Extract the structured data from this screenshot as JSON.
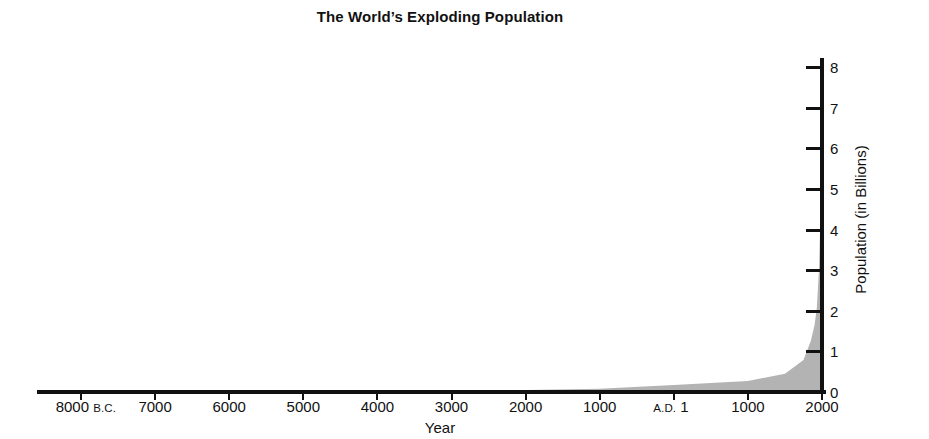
{
  "chart_data": {
    "type": "area",
    "title": "The World’s Exploding Population",
    "xlabel": "Year",
    "ylabel": "Population (in Billions)",
    "xtick_labels": [
      {
        "main": "8000",
        "era": "B.C."
      },
      {
        "main": "7000",
        "era": ""
      },
      {
        "main": "6000",
        "era": ""
      },
      {
        "main": "5000",
        "era": ""
      },
      {
        "main": "4000",
        "era": ""
      },
      {
        "main": "3000",
        "era": ""
      },
      {
        "main": "2000",
        "era": ""
      },
      {
        "main": "1000",
        "era": ""
      },
      {
        "main": "1",
        "era": "A.D."
      },
      {
        "main": "1000",
        "era": ""
      },
      {
        "main": "2000",
        "era": ""
      }
    ],
    "ytick_labels": [
      "0",
      "1",
      "2",
      "3",
      "4",
      "5",
      "6",
      "7",
      "8"
    ],
    "ylim": [
      0,
      8
    ],
    "xlim": [
      -8000,
      2000
    ],
    "x": [
      -8000,
      -7000,
      -6000,
      -5000,
      -4000,
      -3000,
      -2000,
      -1000,
      1,
      1000,
      1500,
      1750,
      1850,
      1900,
      1930,
      1960,
      1975,
      1990,
      2000
    ],
    "values": [
      0.005,
      0.006,
      0.007,
      0.01,
      0.02,
      0.03,
      0.05,
      0.08,
      0.17,
      0.27,
      0.45,
      0.79,
      1.26,
      1.65,
      2.07,
      3.04,
      4.07,
      5.27,
      6.1
    ],
    "series": [
      {
        "name": "World population",
        "values": [
          0.005,
          0.006,
          0.007,
          0.01,
          0.02,
          0.03,
          0.05,
          0.08,
          0.17,
          0.27,
          0.45,
          0.79,
          1.26,
          1.65,
          2.07,
          3.04,
          4.07,
          5.27,
          6.1
        ]
      }
    ],
    "fill_color": "#b3b3b3",
    "axis_color": "#111111",
    "grid": false,
    "legend": "none",
    "yaxis_position": "right"
  }
}
